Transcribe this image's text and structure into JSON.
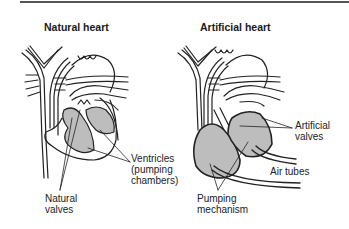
{
  "figure": {
    "colors": {
      "line": "#222222",
      "fill": "#bdbdbd",
      "rule": "#555555",
      "background": "#ffffff"
    },
    "panels": [
      {
        "title": "Natural heart",
        "labels": [
          {
            "id": "ventricles",
            "lines": [
              "Ventricles",
              "(pumping",
              "chambers)"
            ]
          },
          {
            "id": "natural_valves",
            "lines": [
              "Natural",
              "valves"
            ]
          }
        ]
      },
      {
        "title": "Artificial heart",
        "labels": [
          {
            "id": "artificial_valves",
            "lines": [
              "Artificial",
              "valves"
            ]
          },
          {
            "id": "air_tubes",
            "lines": [
              "Air tubes"
            ]
          },
          {
            "id": "pumping_mechanism",
            "lines": [
              "Pumping",
              "mechanism"
            ]
          }
        ]
      }
    ]
  }
}
